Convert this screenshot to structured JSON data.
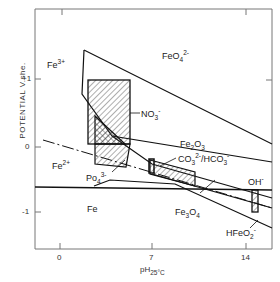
{
  "diagram": {
    "type": "Pourbaix (potential-pH) diagram for iron",
    "y_axis_label": "POTENTIAL  V.she.",
    "x_axis_label_main": "pH",
    "x_axis_label_sub": "25°C",
    "y_ticks": [
      {
        "label": "+1",
        "value": 1
      },
      {
        "label": "0",
        "value": 0
      },
      {
        "label": "-1",
        "value": -1
      }
    ],
    "x_ticks": [
      {
        "label": "0",
        "value": 0
      },
      {
        "label": "7",
        "value": 7
      },
      {
        "label": "14",
        "value": 14
      }
    ],
    "regions": {
      "fe3": {
        "base": "Fe",
        "sup": "3+"
      },
      "feo4": {
        "base": "FeO",
        "sub": "4",
        "sup": "2-"
      },
      "fe2": {
        "base": "Fe",
        "sup": "2+"
      },
      "fe": {
        "base": "Fe"
      },
      "fe2o3": {
        "base": "Fe",
        "sub1": "2",
        "mid": "O",
        "sub2": "3"
      },
      "fe3o4": {
        "base": "Fe",
        "sub1": "3",
        "mid": "O",
        "sub2": "4"
      },
      "hfeo2": {
        "base": "HFeO",
        "sub": "2",
        "sup": "-"
      }
    },
    "annotations": {
      "no3": {
        "base": "NO",
        "sub": "3",
        "sup": "-"
      },
      "po4": {
        "base": "Po",
        "sub": "4",
        "sup": "3-"
      },
      "co3": {
        "base": "CO",
        "sub": "3",
        "sup": "2-",
        "rest": "/HCO",
        "sub2": "3",
        "sup2": "-"
      },
      "oh": {
        "base": "OH",
        "sup": "-"
      }
    }
  }
}
